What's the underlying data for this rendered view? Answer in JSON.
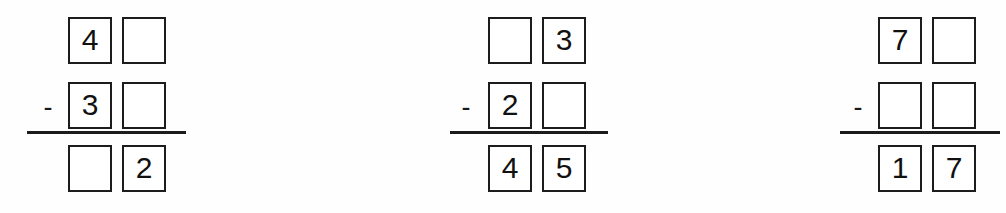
{
  "worksheet": {
    "type": "vertical-subtraction-fill-in-the-blank",
    "operator_symbol": "-",
    "problem_count": 3,
    "problems": [
      {
        "id": "problem-1",
        "x": 27,
        "minuend": {
          "tens": "4",
          "ones": ""
        },
        "subtrahend": {
          "tens": "3",
          "ones": ""
        },
        "difference": {
          "tens": "",
          "ones": "2"
        },
        "operator": "-"
      },
      {
        "id": "problem-2",
        "x": 447,
        "minuend": {
          "tens": "",
          "ones": "3"
        },
        "subtrahend": {
          "tens": "2",
          "ones": ""
        },
        "difference": {
          "tens": "4",
          "ones": "5"
        },
        "operator": "-"
      },
      {
        "id": "problem-3",
        "x": 837,
        "minuend": {
          "tens": "7",
          "ones": ""
        },
        "subtrahend": {
          "tens": "",
          "ones": ""
        },
        "difference": {
          "tens": "1",
          "ones": "7"
        },
        "operator": "-"
      }
    ]
  },
  "style": {
    "box_border_color": "#1c1c1c",
    "digit_color": "#111111",
    "rule_color": "#1c1c1c",
    "background_color": "#fefefe"
  }
}
